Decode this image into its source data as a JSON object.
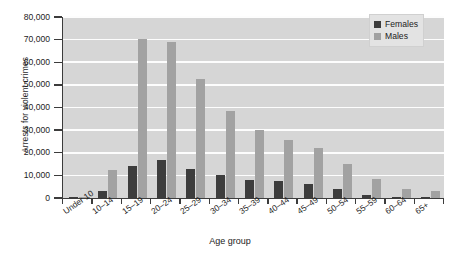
{
  "chart_data": {
    "type": "bar",
    "title": "",
    "xlabel": "Age group",
    "ylabel": "Arrests for violent crimes",
    "ylim": [
      0,
      80000
    ],
    "yticks": [
      "0",
      "10,000",
      "20,000",
      "30,000",
      "40,000",
      "50,000",
      "60,000",
      "70,000",
      "80,000"
    ],
    "ytick_values": [
      0,
      10000,
      20000,
      30000,
      40000,
      50000,
      60000,
      70000,
      80000
    ],
    "grid": true,
    "legend_position": "top-right",
    "categories": [
      "Under 10",
      "10–14",
      "15–19",
      "20–24",
      "25–29",
      "30–34",
      "35–39",
      "40–44",
      "45–49",
      "50–54",
      "55–59",
      "60–64",
      "65+"
    ],
    "series": [
      {
        "name": "Females",
        "color": "#3d3d3d",
        "values": [
          200,
          3000,
          14000,
          16800,
          13000,
          10000,
          8000,
          7300,
          6200,
          3800,
          1400,
          500,
          400
        ]
      },
      {
        "name": "Males",
        "color": "#a2a2a2",
        "values": [
          600,
          12200,
          70500,
          68800,
          52500,
          38500,
          30000,
          25500,
          22300,
          15200,
          8200,
          3800,
          3200
        ]
      }
    ]
  },
  "colors": {
    "plot_background": "#d6d6d6",
    "gridline": "#fdfdfd",
    "axis": "#3c3c3c",
    "page_background": "#ffffff",
    "legend_background": "#e3e3e3"
  }
}
